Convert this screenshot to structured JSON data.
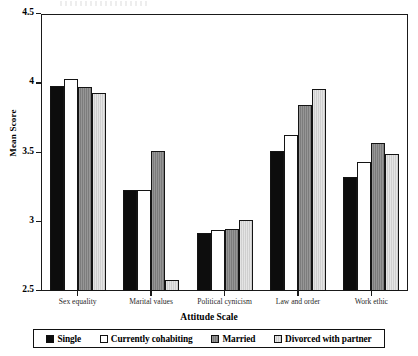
{
  "chart_data": {
    "type": "bar",
    "title": "",
    "xlabel": "Attitude Scale",
    "ylabel": "Mean Score",
    "ylim": [
      2.5,
      4.5
    ],
    "yticks": [
      "2.5",
      "3",
      "3.5",
      "4",
      "4.5"
    ],
    "ytick_values": [
      2.5,
      3,
      3.5,
      4,
      4.5
    ],
    "grid": false,
    "legend_position": "bottom",
    "categories": [
      "Sex equality",
      "Marital values",
      "Political cynicism",
      "Law and order",
      "Work ethic"
    ],
    "series": [
      {
        "name": "Single",
        "color": "#0d0d0d",
        "values": [
          3.98,
          3.23,
          2.92,
          3.51,
          3.32
        ]
      },
      {
        "name": "Currently cohabiting",
        "color": "#ffffff",
        "values": [
          4.03,
          3.23,
          2.94,
          3.63,
          3.43
        ]
      },
      {
        "name": "Married",
        "color": "#7c7c7c",
        "values": [
          3.97,
          3.51,
          2.95,
          3.84,
          3.57
        ]
      },
      {
        "name": "Divorced with partner",
        "color": "#cfcfcf",
        "values": [
          3.93,
          2.58,
          3.01,
          3.96,
          3.49
        ]
      }
    ]
  },
  "legend": {
    "items": [
      {
        "label": "Single",
        "swatch": "swatch-single"
      },
      {
        "label": "Currently cohabiting",
        "swatch": "swatch-currently-cohabiting"
      },
      {
        "label": "Married",
        "swatch": "swatch-married"
      },
      {
        "label": "Divorced with partner",
        "swatch": "swatch-divorced-with-partner"
      }
    ]
  }
}
